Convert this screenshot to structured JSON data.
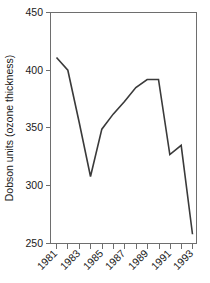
{
  "chart_data": {
    "type": "line",
    "title": "",
    "subtitle": "",
    "xlabel": "",
    "ylabel": "Dobson units (ozone thickness)",
    "x": [
      1981,
      1982,
      1983,
      1984,
      1985,
      1986,
      1987,
      1988,
      1989,
      1990,
      1991,
      1992,
      1993
    ],
    "values": [
      411,
      400,
      355,
      308,
      349,
      362,
      373,
      385,
      392,
      392,
      327,
      335,
      258
    ],
    "series": [
      {
        "name": "ozone thickness",
        "values": [
          411,
          400,
          355,
          308,
          349,
          362,
          373,
          385,
          392,
          392,
          327,
          335,
          258
        ]
      }
    ],
    "xlim": [
      1981,
      1993
    ],
    "ylim": [
      250,
      450
    ],
    "yticks": [
      250,
      300,
      350,
      400,
      450
    ],
    "ytick_labels": [
      "250",
      "300",
      "350",
      "400",
      "450"
    ],
    "xticks": [
      1981,
      1982,
      1983,
      1984,
      1985,
      1986,
      1987,
      1988,
      1989,
      1990,
      1991,
      1992,
      1993
    ],
    "xtick_labels_shown": [
      "1981",
      "1983",
      "1985",
      "1987",
      "1989",
      "1991",
      "1993"
    ],
    "xtick_label_rotation": -45,
    "grid": false,
    "legend": false,
    "legend_position": "none",
    "line_color": "#3a3a3a",
    "axis_color": "#6e6e6e",
    "background_color": "#ffffff"
  },
  "axes": {
    "y_axis_title": "Dobson units (ozone thickness)",
    "y_tick_250": "250",
    "y_tick_300": "300",
    "y_tick_350": "350",
    "y_tick_400": "400",
    "y_tick_450": "450",
    "x_tick_1981": "1981",
    "x_tick_1983": "1983",
    "x_tick_1985": "1985",
    "x_tick_1987": "1987",
    "x_tick_1989": "1989",
    "x_tick_1991": "1991",
    "x_tick_1993": "1993"
  }
}
